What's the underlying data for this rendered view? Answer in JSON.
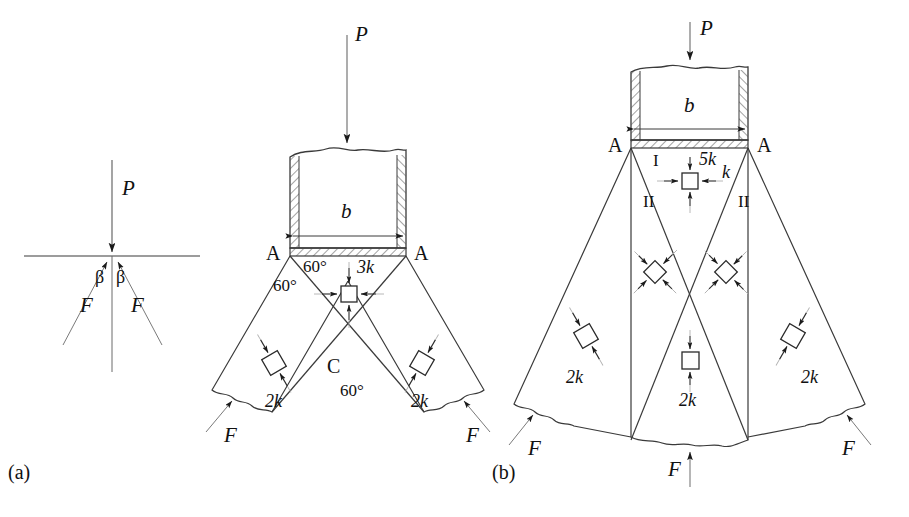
{
  "figure": {
    "kind": "slip-line-field-punch-indentation",
    "panels": [
      {
        "id": "a",
        "caption": "(a)",
        "caption_x": 8,
        "caption_y": 462
      },
      {
        "id": "b",
        "caption": "(b)",
        "caption_x": 492,
        "caption_y": 462
      }
    ]
  },
  "panel_a_left": {
    "load_label": "P",
    "angle_label_left": "β",
    "angle_label_right": "β",
    "force_label_left": "F",
    "force_label_right": "F"
  },
  "panel_a_punch": {
    "load_label": "P",
    "width_label": "b",
    "corner_label_left": "A",
    "corner_label_right": "A",
    "angle_top_left": "60°",
    "angle_wedge_left": "60°",
    "angle_bottom": "60°",
    "center_point_label": "C",
    "stress_center_label": "3k",
    "stress_left_label": "2k",
    "stress_right_label": "2k",
    "force_left_label": "F",
    "force_right_label": "F"
  },
  "panel_b_punch": {
    "load_label": "P",
    "width_label": "b",
    "corner_label_left": "A",
    "corner_label_right": "A",
    "zone_label_I": "I",
    "zone_label_II_left": "II",
    "zone_label_II_right": "II",
    "stress_top_label": "5k",
    "stress_top_label_side": "k",
    "stress_mid_left_label": "",
    "stress_mid_right_label": "",
    "stress_center_label": "2k",
    "stress_outer_left_label": "2k",
    "stress_outer_right_label": "2k",
    "force_left_label": "F",
    "force_right_label": "F",
    "force_bottom_label": "F"
  },
  "style": {
    "line_color": "#3a3a3a",
    "text_color": "#111111",
    "hatch_color": "#555555",
    "background": "#ffffff"
  }
}
